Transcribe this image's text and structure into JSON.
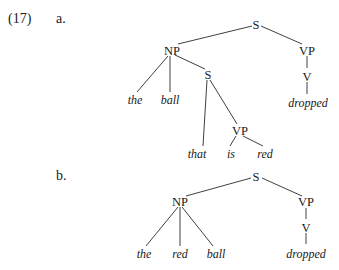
{
  "example": {
    "number": "(17)",
    "a": {
      "label": "a.",
      "nodes": {
        "S": "S",
        "NP": "NP",
        "VP": "VP",
        "S_rel": "S",
        "V": "V",
        "VP_rel": "VP"
      },
      "words": {
        "the": "the",
        "ball": "ball",
        "dropped": "dropped",
        "that": "that",
        "is": "is",
        "red": "red"
      }
    },
    "b": {
      "label": "b.",
      "nodes": {
        "S": "S",
        "NP": "NP",
        "VP": "VP",
        "V": "V"
      },
      "words": {
        "the": "the",
        "red": "red",
        "ball": "ball",
        "dropped": "dropped"
      }
    }
  }
}
